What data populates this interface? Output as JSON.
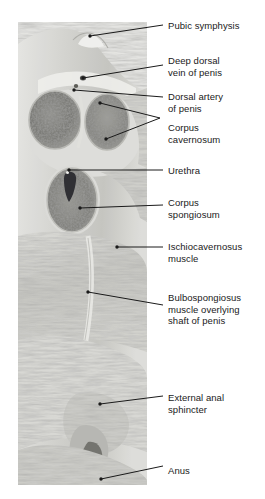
{
  "figure": {
    "type": "anatomical-photograph-with-labels",
    "modality": "cadaveric gross anatomy photograph, greyscale",
    "photo": {
      "left": 18,
      "top": 22,
      "width": 129,
      "height": 463,
      "tone_light": "#e8e8e6",
      "tone_mid": "#b8b8b4",
      "tone_dark": "#5a5a57"
    },
    "background": "#ffffff",
    "label_color": "#1a1a1a",
    "leader_color": "#1a1a1a"
  },
  "labels": [
    {
      "id": "pubic-symphysis",
      "lines": [
        "Pubic symphysis"
      ],
      "x": 168,
      "y": 20,
      "leader": {
        "from": [
          90,
          36
        ],
        "to": [
          163,
          25
        ],
        "dot": true
      }
    },
    {
      "id": "deep-dorsal-vein",
      "lines": [
        "Deep dorsal",
        "vein of penis"
      ],
      "x": 168,
      "y": 55,
      "leader": {
        "from": [
          83,
          78
        ],
        "to": [
          163,
          65
        ],
        "dot": true
      }
    },
    {
      "id": "dorsal-artery",
      "lines": [
        "Dorsal artery",
        "of penis"
      ],
      "x": 168,
      "y": 91,
      "leader": {
        "from": [
          74,
          90
        ],
        "to": [
          163,
          97
        ],
        "dot": true
      }
    },
    {
      "id": "corpus-cavernosum",
      "lines": [
        "Corpus",
        "cavernosum"
      ],
      "x": 168,
      "y": 122,
      "leader": {
        "bracket": true,
        "apex": [
          160,
          118
        ],
        "branches": [
          [
            100,
            103
          ],
          [
            106,
            139
          ]
        ],
        "dot": true
      }
    },
    {
      "id": "urethra",
      "lines": [
        "Urethra"
      ],
      "x": 168,
      "y": 165,
      "leader": {
        "from": [
          69,
          170
        ],
        "to": [
          163,
          170
        ],
        "dot": true
      }
    },
    {
      "id": "corpus-spongiosum",
      "lines": [
        "Corpus",
        "spongiosum"
      ],
      "x": 168,
      "y": 197,
      "leader": {
        "from": [
          80,
          208
        ],
        "to": [
          163,
          205
        ],
        "dot": true
      }
    },
    {
      "id": "ischiocavernosus",
      "lines": [
        "Ischiocavernosus",
        "muscle"
      ],
      "x": 168,
      "y": 241,
      "leader": {
        "from": [
          117,
          247
        ],
        "to": [
          163,
          247
        ],
        "dot": true
      }
    },
    {
      "id": "bulbospongiosus",
      "lines": [
        "Bulbospongiosus",
        "muscle overlying",
        "shaft of penis"
      ],
      "x": 168,
      "y": 292,
      "leader": {
        "from": [
          88,
          292
        ],
        "to": [
          163,
          305
        ],
        "dot": true
      }
    },
    {
      "id": "external-anal-sphincter",
      "lines": [
        "External anal",
        "sphincter"
      ],
      "x": 168,
      "y": 392,
      "leader": {
        "from": [
          100,
          404
        ],
        "to": [
          163,
          396
        ],
        "dot": true
      }
    },
    {
      "id": "anus",
      "lines": [
        "Anus"
      ],
      "x": 168,
      "y": 465,
      "leader": {
        "from": [
          101,
          479
        ],
        "to": [
          163,
          466
        ],
        "dot": true
      }
    }
  ],
  "structures": {
    "corpus_cavernosum_left": {
      "cx": 55,
      "cy": 120,
      "rx": 26,
      "ry": 29
    },
    "corpus_cavernosum_right": {
      "cx": 107,
      "cy": 122,
      "rx": 22,
      "ry": 28
    },
    "corpus_spongiosum": {
      "cx": 72,
      "cy": 200,
      "rx": 26,
      "ry": 33
    },
    "urethral_lumen": {
      "cx": 68,
      "cy": 178,
      "w": 9,
      "h": 20
    },
    "pubic_symphysis_apex": {
      "x": 90,
      "y": 36
    }
  }
}
